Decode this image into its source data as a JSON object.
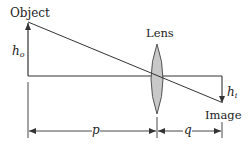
{
  "diagram": {
    "type": "thin-lens ray diagram",
    "labels": {
      "object": "Object",
      "lens": "Lens",
      "image": "Image",
      "object_height": "h",
      "object_height_sub": "o",
      "image_height": "h",
      "image_height_sub": "i",
      "object_distance": "p",
      "image_distance": "q"
    },
    "colors": {
      "line": "#333333",
      "lens_fill": "#c8c8c8",
      "lens_stroke": "#444444",
      "background": "#ffffff"
    }
  }
}
